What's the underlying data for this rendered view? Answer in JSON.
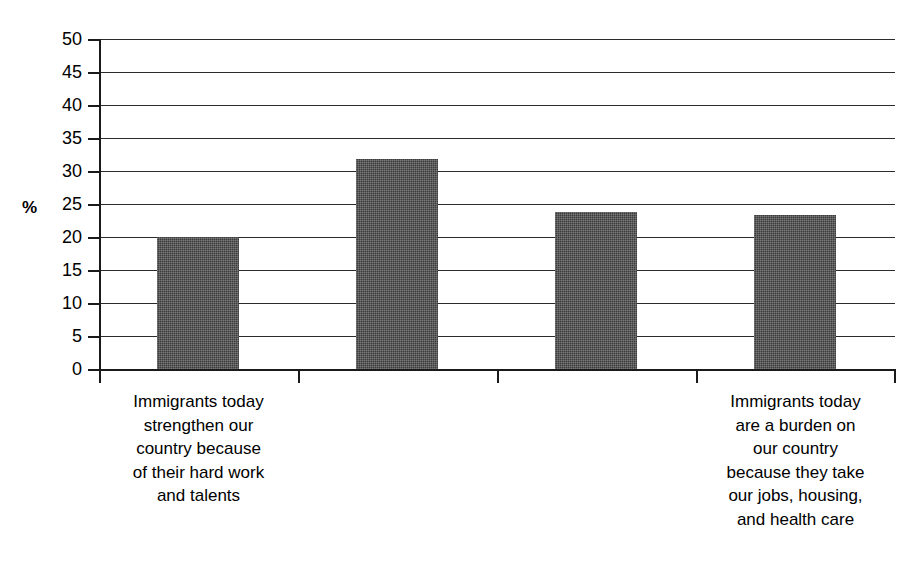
{
  "chart_data": {
    "type": "bar",
    "title": "",
    "subtitle": "",
    "xlabel": "",
    "ylabel": "%",
    "ylim": [
      0,
      50
    ],
    "ytick_step": 5,
    "grid": true,
    "legend": null,
    "categories": [
      "Immigrants today strengthen our country because of their hard work and talents",
      "",
      "",
      "Immigrants today are a burden on our country because they take our jobs, housing, and health care"
    ],
    "category_label_lines": [
      [
        "Immigrants today",
        "strengthen our",
        "country because",
        "of their hard work",
        "and talents"
      ],
      [],
      [],
      [
        "Immigrants today",
        "are a burden on",
        "our country",
        "because they take",
        "our jobs, housing,",
        "and health care"
      ]
    ],
    "values": [
      20.0,
      31.8,
      23.8,
      23.4
    ],
    "yticks": [
      "0",
      "5",
      "10",
      "15",
      "20",
      "25",
      "30",
      "35",
      "40",
      "45",
      "50"
    ],
    "bar_color": "#3b3b3b",
    "axis_color": "#1a1a1a",
    "gridline_color": "#2b2b2b",
    "background_color": "#ffffff"
  }
}
